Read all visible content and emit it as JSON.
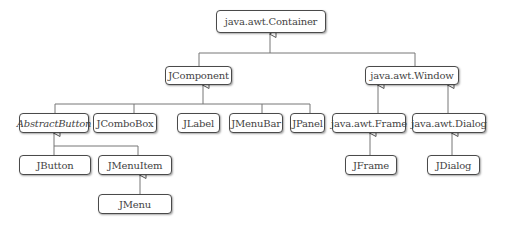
{
  "diagram": {
    "type": "class-hierarchy",
    "nodes": {
      "container": "java.awt.Container",
      "jcomponent": "JComponent",
      "window": "java.awt.Window",
      "abstractbutton": "AbstractButton",
      "jcombobox": "JComboBox",
      "jlabel": "JLabel",
      "jmenubar": "JMenuBar",
      "jpanel": "JPanel",
      "frame": "java.awt.Frame",
      "dialog": "java.awt.Dialog",
      "jbutton": "JButton",
      "jmenuitem": "JMenuItem",
      "jframe": "JFrame",
      "jdialog": "JDialog",
      "jmenu": "JMenu"
    },
    "edges": [
      [
        "JComponent",
        "java.awt.Container"
      ],
      [
        "java.awt.Window",
        "java.awt.Container"
      ],
      [
        "AbstractButton",
        "JComponent"
      ],
      [
        "JComboBox",
        "JComponent"
      ],
      [
        "JLabel",
        "JComponent"
      ],
      [
        "JMenuBar",
        "JComponent"
      ],
      [
        "JPanel",
        "JComponent"
      ],
      [
        "java.awt.Frame",
        "java.awt.Window"
      ],
      [
        "java.awt.Dialog",
        "java.awt.Window"
      ],
      [
        "JButton",
        "AbstractButton"
      ],
      [
        "JMenuItem",
        "AbstractButton"
      ],
      [
        "JMenu",
        "JMenuItem"
      ],
      [
        "JFrame",
        "java.awt.Frame"
      ],
      [
        "JDialog",
        "java.awt.Dialog"
      ]
    ]
  }
}
